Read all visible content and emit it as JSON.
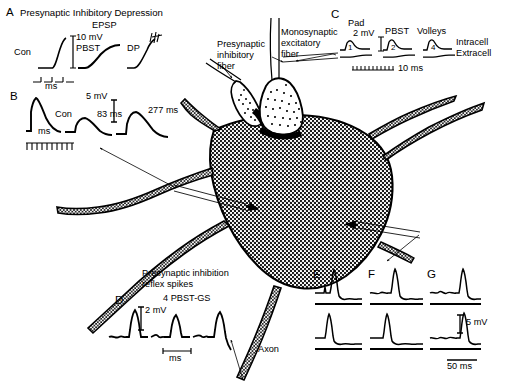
{
  "figure": {
    "background_color": "#ffffff",
    "ink_color": "#000000"
  },
  "cell": {
    "soma_label": "motoneuron-soma",
    "axon_label": "Axon",
    "membrane_fill": "#ffffff",
    "stipple_color": "#000000"
  },
  "annotations": {
    "presynaptic_inhibitory_fiber": "Presynaptic\ninhibitory\nfiber",
    "monosynaptic_excitatory_fiber": "Monosynaptic\nexcitatory\nfiber"
  },
  "panels": {
    "A": {
      "letter": "A",
      "title": "Presynaptic Inhibitory Depression",
      "response_label": "EPSP",
      "voltage_calibration": "10 mV",
      "time_calibration": "ms",
      "traces": [
        {
          "name": "Con",
          "label": "Con"
        },
        {
          "name": "PBST",
          "label": "PBST"
        },
        {
          "name": "DP",
          "label": "DP"
        }
      ]
    },
    "B": {
      "letter": "B",
      "voltage_calibration": "5 mV",
      "time_calibration": "ms",
      "traces": [
        {
          "name": "control",
          "label": "Con"
        },
        {
          "name": "interval-83",
          "label": "83 ms"
        },
        {
          "name": "interval-277",
          "label": "277 ms"
        }
      ]
    },
    "C": {
      "letter": "C",
      "headers": [
        "Pad",
        "PBST",
        "Volleys"
      ],
      "voltage_calibration": "2 mV",
      "time_calibration": "10 ms",
      "recording_rows": [
        "Intracell",
        "Extracell"
      ],
      "trace_numbers": [
        "1",
        "2",
        "4"
      ]
    },
    "D": {
      "letter": "D",
      "title": "Presynaptic inhibition\nreflex spikes",
      "condition": "4 PBST-GS",
      "voltage_calibration": "2 mV",
      "time_calibration": "ms"
    },
    "E": {
      "letter": "E"
    },
    "F": {
      "letter": "F"
    },
    "G": {
      "letter": "G"
    },
    "EFG_calibration": {
      "voltage": "5 mV",
      "time": "50 ms"
    }
  }
}
